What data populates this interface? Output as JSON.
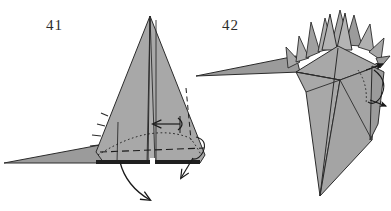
{
  "page": {
    "background_color": "#ffffff",
    "width": 391,
    "height": 211
  },
  "style": {
    "paper_front_color": "#a8a8a8",
    "paper_shade_color": "#9b9b9b",
    "paper_light_color": "#b4b4b4",
    "outline_color": "#2b2b2b",
    "crease_color": "#3a3a3a",
    "arrow_color": "#1a1a1a",
    "label_color": "#2b2b2b"
  },
  "steps": [
    {
      "number": "41",
      "label_x": 46,
      "label_y": 30,
      "description": "Shaded origami model with tall central peak, horizontal base and two fold arrows",
      "arrows": [
        {
          "name": "rotate-fold-arrow",
          "direction": "left"
        },
        {
          "name": "valley-fold-arrow-down-right",
          "direction": "down-left"
        },
        {
          "name": "valley-fold-arrow-down-center",
          "direction": "down-right"
        }
      ]
    },
    {
      "number": "42",
      "label_x": 222,
      "label_y": 30,
      "description": "Shaded origami model with spiked crown of points, long left beak and downward pointing body",
      "arrows": [
        {
          "name": "curl-fold-arrow-right",
          "direction": "right"
        }
      ]
    }
  ]
}
